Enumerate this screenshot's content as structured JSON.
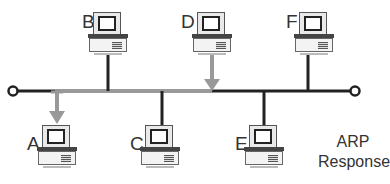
{
  "diagram": {
    "title": "ARP Response",
    "caption_lines": [
      "ARP",
      "Response"
    ],
    "colors": {
      "bus": "#222222",
      "signal": "#999999",
      "text": "#333333"
    },
    "bus": {
      "y": 91,
      "x_start": 15,
      "x_end": 353,
      "signal_from_x": 55,
      "signal_to_x": 212
    },
    "nodes": [
      {
        "id": "B",
        "label": "B",
        "position": "top",
        "x": 108,
        "link": "normal"
      },
      {
        "id": "D",
        "label": "D",
        "position": "top",
        "x": 212,
        "link": "sender-arrow-down"
      },
      {
        "id": "F",
        "label": "F",
        "position": "top",
        "x": 308,
        "link": "normal"
      },
      {
        "id": "A",
        "label": "A",
        "position": "bottom",
        "x": 57,
        "link": "receiver-arrow-down"
      },
      {
        "id": "C",
        "label": "C",
        "position": "bottom",
        "x": 162,
        "link": "normal"
      },
      {
        "id": "E",
        "label": "E",
        "position": "bottom",
        "x": 264,
        "link": "normal"
      }
    ],
    "edges": [
      {
        "from": "D",
        "to": "A",
        "type": "arp-response",
        "style": "gray-arrow"
      }
    ]
  }
}
